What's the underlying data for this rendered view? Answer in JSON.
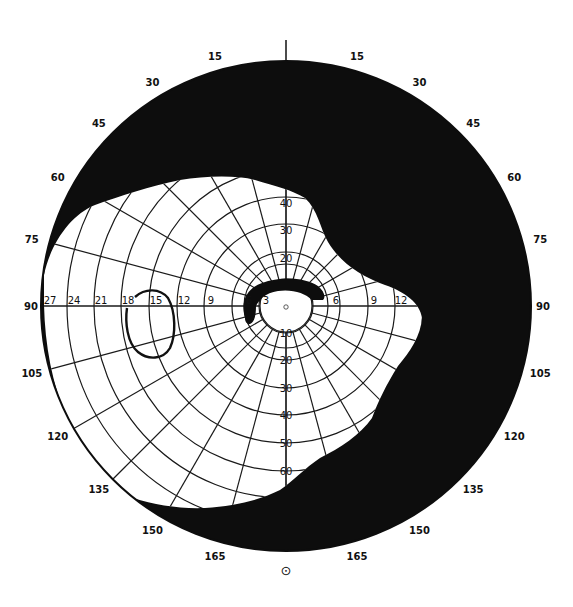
{
  "chart_data": {
    "type": "diagram",
    "title": "",
    "center": [
      286,
      306
    ],
    "outer_radius": 245,
    "colors": {
      "background": "#ffffff",
      "field_loss": "#0d0d0d",
      "grid": "#1a1a1a",
      "label": "#111111"
    },
    "meridian_labels": {
      "upper_left": [
        "15",
        "30",
        "45",
        "60",
        "75"
      ],
      "upper_right": [
        "15",
        "30",
        "45",
        "60",
        "75"
      ],
      "left": "90",
      "right": "90",
      "lower_left": [
        "105",
        "120",
        "135",
        "150",
        "165"
      ],
      "lower_right": [
        "105",
        "120",
        "135",
        "150",
        "165"
      ]
    },
    "horizontal_axis_labels_left": [
      "27",
      "24",
      "21",
      "18",
      "15",
      "12",
      "9",
      "6",
      "3"
    ],
    "horizontal_axis_labels_right": [
      "6",
      "9",
      "12"
    ],
    "vertical_axis_labels_upper": [
      "20",
      "30",
      "40"
    ],
    "vertical_axis_labels_lower": [
      "10",
      "20",
      "30",
      "40",
      "50",
      "60"
    ],
    "ring_radii_px": [
      27,
      42,
      54,
      82,
      109,
      137,
      165,
      192,
      219
    ],
    "spoke_interval_deg": 15,
    "fixation_symbol": "⊙",
    "regions": [
      {
        "name": "seeing-field",
        "color": "white"
      },
      {
        "name": "field-loss",
        "color": "black"
      },
      {
        "name": "paracentral-arcuate-scotoma",
        "color": "black"
      },
      {
        "name": "blind-spot-outline",
        "color": "outline"
      }
    ]
  }
}
